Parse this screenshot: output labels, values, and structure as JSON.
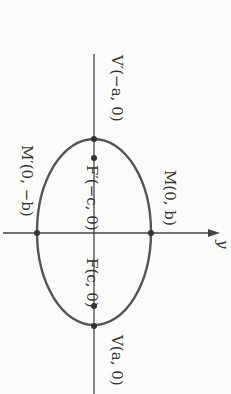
{
  "diagram": {
    "type": "ellipse-with-foci",
    "rotation_deg": 90,
    "axis_label": "y",
    "labels": {
      "v_prime": "V′(−a, 0)",
      "v": "V(a, 0)",
      "f_prime": "F′(−c, 0)",
      "f": "F(c, 0)",
      "m": "M(0, b)",
      "m_prime": "M′(0, −b)"
    },
    "colors": {
      "stroke": "#444444",
      "text": "#333333",
      "background": "#fbfbfa"
    }
  }
}
